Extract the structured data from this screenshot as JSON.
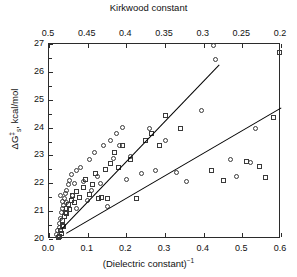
{
  "chart_data": {
    "type": "scatter",
    "title": "",
    "xlabel": "(Dielectric constant)⁻¹",
    "ylabel": "ΔG ‡ s, kcal/mol",
    "top_axis_label": "Kirkwood constant",
    "xlim": [
      0.0,
      0.6
    ],
    "ylim": [
      20,
      27
    ],
    "top_xlim": [
      0.5,
      0.2
    ],
    "grid": false,
    "legend": "none",
    "xticks": [
      "0.0",
      "0.1",
      "0.2",
      "0.3",
      "0.4",
      "0.5",
      "0.6"
    ],
    "xtick_values": [
      0.0,
      0.1,
      0.2,
      0.3,
      0.4,
      0.5,
      0.6
    ],
    "yticks": [
      "20",
      "21",
      "22",
      "23",
      "24",
      "25",
      "26",
      "27"
    ],
    "ytick_values": [
      20,
      21,
      22,
      23,
      24,
      25,
      26,
      27
    ],
    "top_xticks": [
      "0.5",
      "0.45",
      "0.4",
      "0.35",
      "0.3",
      "0.25",
      "0.2"
    ],
    "top_xtick_values": [
      0.5,
      0.45,
      0.4,
      0.35,
      0.3,
      0.25,
      0.2
    ],
    "series": [
      {
        "name": "circles",
        "marker": "circle",
        "points": [
          [
            0.02,
            20.15
          ],
          [
            0.022,
            20.3
          ],
          [
            0.024,
            20.05
          ],
          [
            0.026,
            20.55
          ],
          [
            0.028,
            20.4
          ],
          [
            0.03,
            20.75
          ],
          [
            0.032,
            20.95
          ],
          [
            0.034,
            21.1
          ],
          [
            0.036,
            21.35
          ],
          [
            0.03,
            21.55
          ],
          [
            0.038,
            21.2
          ],
          [
            0.04,
            21.45
          ],
          [
            0.042,
            21.65
          ],
          [
            0.044,
            21.3
          ],
          [
            0.046,
            21.75
          ],
          [
            0.05,
            21.95
          ],
          [
            0.052,
            22.1
          ],
          [
            0.058,
            22.3
          ],
          [
            0.06,
            21.55
          ],
          [
            0.065,
            22.0
          ],
          [
            0.07,
            22.45
          ],
          [
            0.072,
            21.1
          ],
          [
            0.082,
            22.55
          ],
          [
            0.09,
            22.05
          ],
          [
            0.1,
            21.4
          ],
          [
            0.105,
            22.85
          ],
          [
            0.11,
            21.75
          ],
          [
            0.118,
            23.1
          ],
          [
            0.125,
            22.25
          ],
          [
            0.132,
            22.0
          ],
          [
            0.14,
            23.35
          ],
          [
            0.15,
            21.15
          ],
          [
            0.16,
            23.55
          ],
          [
            0.168,
            22.9
          ],
          [
            0.175,
            23.8
          ],
          [
            0.182,
            23.35
          ],
          [
            0.19,
            24.0
          ],
          [
            0.2,
            22.15
          ],
          [
            0.21,
            22.95
          ],
          [
            0.24,
            22.35
          ],
          [
            0.26,
            23.95
          ],
          [
            0.275,
            22.45
          ],
          [
            0.3,
            23.55
          ],
          [
            0.33,
            22.4
          ],
          [
            0.355,
            22.05
          ],
          [
            0.395,
            24.6
          ],
          [
            0.425,
            26.95
          ],
          [
            0.43,
            26.45
          ],
          [
            0.47,
            22.85
          ],
          [
            0.485,
            22.25
          ],
          [
            0.52,
            22.75
          ],
          [
            0.535,
            23.95
          ]
        ]
      },
      {
        "name": "squares",
        "marker": "square",
        "points": [
          [
            0.024,
            20.05
          ],
          [
            0.028,
            20.1
          ],
          [
            0.03,
            20.3
          ],
          [
            0.032,
            20.2
          ],
          [
            0.034,
            20.5
          ],
          [
            0.036,
            20.65
          ],
          [
            0.038,
            20.45
          ],
          [
            0.04,
            20.8
          ],
          [
            0.042,
            20.95
          ],
          [
            0.044,
            21.1
          ],
          [
            0.046,
            20.9
          ],
          [
            0.05,
            21.25
          ],
          [
            0.054,
            21.05
          ],
          [
            0.058,
            21.4
          ],
          [
            0.062,
            21.55
          ],
          [
            0.066,
            21.3
          ],
          [
            0.072,
            21.7
          ],
          [
            0.08,
            21.5
          ],
          [
            0.088,
            21.85
          ],
          [
            0.095,
            22.15
          ],
          [
            0.105,
            21.6
          ],
          [
            0.112,
            21.95
          ],
          [
            0.12,
            22.35
          ],
          [
            0.128,
            21.45
          ],
          [
            0.136,
            21.5
          ],
          [
            0.145,
            22.5
          ],
          [
            0.152,
            21.45
          ],
          [
            0.16,
            22.7
          ],
          [
            0.17,
            23.1
          ],
          [
            0.18,
            22.55
          ],
          [
            0.19,
            23.35
          ],
          [
            0.21,
            22.85
          ],
          [
            0.225,
            21.45
          ],
          [
            0.25,
            23.55
          ],
          [
            0.265,
            23.8
          ],
          [
            0.285,
            23.35
          ],
          [
            0.3,
            24.45
          ],
          [
            0.34,
            23.95
          ],
          [
            0.42,
            22.45
          ],
          [
            0.45,
            22.1
          ],
          [
            0.51,
            22.8
          ],
          [
            0.545,
            22.6
          ],
          [
            0.56,
            22.2
          ],
          [
            0.58,
            24.35
          ],
          [
            0.595,
            26.7
          ]
        ]
      }
    ],
    "trend_lines": [
      {
        "name": "upper-fit",
        "x0": 0.032,
        "y0": 20.35,
        "x1": 0.44,
        "y1": 26.25
      },
      {
        "name": "lower-fit",
        "x0": 0.045,
        "y0": 20.2,
        "x1": 0.6,
        "y1": 24.7
      }
    ]
  }
}
